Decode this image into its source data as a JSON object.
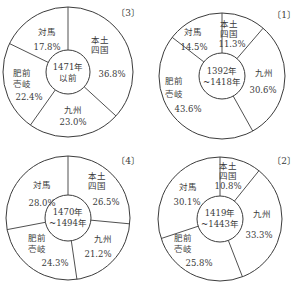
{
  "chart_data": [
    {
      "type": "pie",
      "subtype": "donut",
      "panel_label": "〔1〕",
      "center_label": [
        "1392年",
        "~1418年"
      ],
      "period": "1392年~1418年",
      "categories": [
        "本土四国",
        "九州",
        "肥前壱岐",
        "対馬"
      ],
      "values": [
        11.3,
        30.6,
        43.6,
        14.5
      ],
      "unit": "%",
      "labels": [
        {
          "name": [
            "本土",
            "四国"
          ],
          "value": "11.3%"
        },
        {
          "name": [
            "九州"
          ],
          "value": "30.6%"
        },
        {
          "name": [
            "肥前",
            "壱岐"
          ],
          "value": "43.6%"
        },
        {
          "name": [
            "対馬"
          ],
          "value": "14.5%"
        }
      ],
      "geometry": {
        "cx": 222,
        "cy": 76,
        "r": 63,
        "ri": 23
      }
    },
    {
      "type": "pie",
      "subtype": "donut",
      "panel_label": "〔2〕",
      "center_label": [
        "1419年",
        "~1443年"
      ],
      "period": "1419年~1443年",
      "categories": [
        "本土四国",
        "九州",
        "肥前壱岐",
        "対馬"
      ],
      "values": [
        10.8,
        33.3,
        25.8,
        30.1
      ],
      "unit": "%",
      "labels": [
        {
          "name": [
            "本土",
            "四国"
          ],
          "value": "10.8%"
        },
        {
          "name": [
            "九州"
          ],
          "value": "33.3%"
        },
        {
          "name": [
            "肥前",
            "壱岐"
          ],
          "value": "25.8%"
        },
        {
          "name": [
            "対馬"
          ],
          "value": "30.1%"
        }
      ],
      "geometry": {
        "cx": 220,
        "cy": 219,
        "r": 62,
        "ri": 23
      }
    },
    {
      "type": "pie",
      "subtype": "donut",
      "panel_label": "〔3〕",
      "center_label": [
        "1471年",
        "以前"
      ],
      "period": "1471年以前",
      "categories": [
        "本土四国",
        "九州",
        "肥前壱岐",
        "対馬"
      ],
      "values": [
        36.8,
        23.0,
        22.4,
        17.8
      ],
      "unit": "%",
      "labels": [
        {
          "name": [
            "本土",
            "四国"
          ],
          "value": "36.8%"
        },
        {
          "name": [
            "九州"
          ],
          "value": "23.0%"
        },
        {
          "name": [
            "肥前",
            "壱岐"
          ],
          "value": "22.4%"
        },
        {
          "name": [
            "対馬"
          ],
          "value": "17.8%"
        }
      ],
      "geometry": {
        "cx": 68,
        "cy": 72,
        "r": 65,
        "ri": 22
      }
    },
    {
      "type": "pie",
      "subtype": "donut",
      "panel_label": "〔4〕",
      "center_label": [
        "1470年",
        "~1494年"
      ],
      "period": "1470年~1494年",
      "categories": [
        "本土四国",
        "九州",
        "肥前壱岐",
        "対馬"
      ],
      "values": [
        26.5,
        21.2,
        24.3,
        28.0
      ],
      "unit": "%",
      "labels": [
        {
          "name": [
            "本土",
            "四国"
          ],
          "value": "26.5%"
        },
        {
          "name": [
            "九州"
          ],
          "value": "21.2%"
        },
        {
          "name": [
            "肥前",
            "壱岐"
          ],
          "value": "24.3%"
        },
        {
          "name": [
            "対馬"
          ],
          "value": "28.0%"
        }
      ],
      "geometry": {
        "cx": 68,
        "cy": 218,
        "r": 62,
        "ri": 23
      }
    }
  ],
  "panels": {
    "p1": {
      "label": "〔1〕",
      "center": [
        "1392年",
        "~1418年"
      ],
      "s0": {
        "n1": "本土",
        "n2": "四国",
        "v": "11.3%"
      },
      "s1": {
        "n1": "九州",
        "v": "30.6%"
      },
      "s2": {
        "n1": "肥前",
        "n2": "壱岐",
        "v": "43.6%"
      },
      "s3": {
        "n1": "対馬",
        "v": "14.5%"
      }
    },
    "p2": {
      "label": "〔2〕",
      "center": [
        "1419年",
        "~1443年"
      ],
      "s0": {
        "n1": "本土",
        "n2": "四国",
        "v": "10.8%"
      },
      "s1": {
        "n1": "九州",
        "v": "33.3%"
      },
      "s2": {
        "n1": "肥前",
        "n2": "壱岐",
        "v": "25.8%"
      },
      "s3": {
        "n1": "対馬",
        "v": "30.1%"
      }
    },
    "p3": {
      "label": "〔3〕",
      "center": [
        "1471年",
        "以前"
      ],
      "s0": {
        "n1": "本土",
        "n2": "四国",
        "v": "36.8%"
      },
      "s1": {
        "n1": "九州",
        "v": "23.0%"
      },
      "s2": {
        "n1": "肥前",
        "n2": "壱岐",
        "v": "22.4%"
      },
      "s3": {
        "n1": "対馬",
        "v": "17.8%"
      }
    },
    "p4": {
      "label": "〔4〕",
      "center": [
        "1470年",
        "~1494年"
      ],
      "s0": {
        "n1": "本土",
        "n2": "四国",
        "v": "26.5%"
      },
      "s1": {
        "n1": "九州",
        "v": "21.2%"
      },
      "s2": {
        "n1": "肥前",
        "n2": "壱岐",
        "v": "24.3%"
      },
      "s3": {
        "n1": "対馬",
        "v": "28.0%"
      }
    }
  },
  "style": {
    "line_color": "#3c3c3c",
    "text_color": "#3a3a3a",
    "background": "#ffffff"
  }
}
